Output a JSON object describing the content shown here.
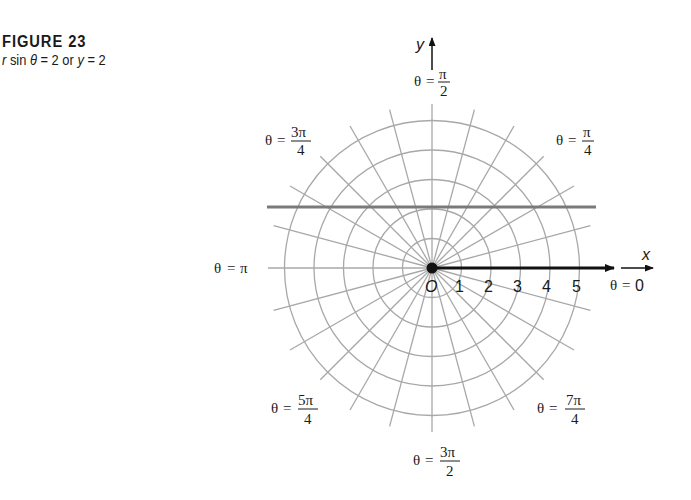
{
  "figure": {
    "title": "FIGURE 23",
    "equation_prefix_r": "r",
    "equation_middle": " sin ",
    "equation_theta": "θ",
    "equation_rest": " = 2 or ",
    "equation_y": "y",
    "equation_end": " = 2"
  },
  "axes": {
    "x_label": "x",
    "y_label": "y",
    "origin_label": "O",
    "tick_labels": [
      "1",
      "2",
      "3",
      "4",
      "5"
    ]
  },
  "angle_labels": {
    "theta_symbol": "θ",
    "equals": "=",
    "pi_half": {
      "num": "π",
      "den": "2"
    },
    "three_pi_quarter": {
      "num": "3π",
      "den": "4"
    },
    "pi_quarter": {
      "num": "π",
      "den": "4"
    },
    "pi": "π",
    "zero": "0",
    "five_pi_quarter": {
      "num": "5π",
      "den": "4"
    },
    "seven_pi_quarter": {
      "num": "7π",
      "den": "4"
    },
    "three_pi_half": {
      "num": "3π",
      "den": "2"
    }
  },
  "colors": {
    "grid": "#a8a8a8",
    "line_y2": "#7a7a7a",
    "axis": "#111111",
    "text": "#1a1a1a"
  },
  "chart_data": {
    "type": "polar-graph",
    "title": "FIGURE 23",
    "subtitle": "r sin θ = 2 or y = 2",
    "grid": {
      "circles_r": [
        1,
        2,
        3,
        4,
        5
      ],
      "ray_spacing_deg": 15,
      "ray_count": 24
    },
    "curves": [
      {
        "name": "r sin θ = 2",
        "cartesian": "y = 2",
        "type": "horizontal-line",
        "y": 2,
        "x_range": [
          -5.5,
          5.5
        ]
      }
    ],
    "polar_axis_ticks": [
      1,
      2,
      3,
      4,
      5
    ],
    "angle_labels": [
      "θ = π/2",
      "θ = 3π/4",
      "θ = π/4",
      "θ = π",
      "θ = 0",
      "θ = 5π/4",
      "θ = 7π/4",
      "θ = 3π/2"
    ],
    "xlabel": "x",
    "ylabel": "y"
  }
}
